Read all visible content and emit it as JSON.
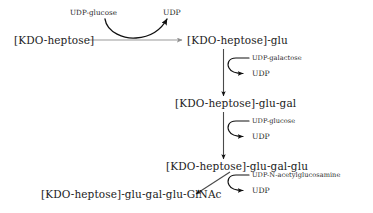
{
  "diagram": {
    "type": "reaction-pathway",
    "colors": {
      "text": "#1b1b1b",
      "arrow_dark": "#111111",
      "arrow_light": "#8f8f8f",
      "background": "#ffffff"
    },
    "nodes": [
      {
        "id": "n1",
        "label": "[KDO-heptose]"
      },
      {
        "id": "n2",
        "label": "[KDO-heptose]-glu"
      },
      {
        "id": "n3",
        "label": "[KDO-heptose]-glu-gal"
      },
      {
        "id": "n4",
        "label": "[KDO-heptose]-glu-gal-glu"
      },
      {
        "id": "n5",
        "label": "[KDO-heptose]-glu-gal-glu-GlNAc"
      }
    ],
    "reactions": [
      {
        "id": "r1",
        "from": "n1",
        "to": "n2",
        "direction": "horizontal",
        "substrate": "UDP-glucose",
        "product": "UDP"
      },
      {
        "id": "r2",
        "from": "n2",
        "to": "n3",
        "direction": "vertical",
        "substrate": "UDP-galactose",
        "product": "UDP"
      },
      {
        "id": "r3",
        "from": "n3",
        "to": "n4",
        "direction": "vertical",
        "substrate": "UDP-glucose",
        "product": "UDP"
      },
      {
        "id": "r4",
        "from": "n4",
        "to": "n5",
        "direction": "diagonal-down-left",
        "substrate": "UDP-N-acetylglucosamine",
        "product": "UDP"
      }
    ]
  }
}
